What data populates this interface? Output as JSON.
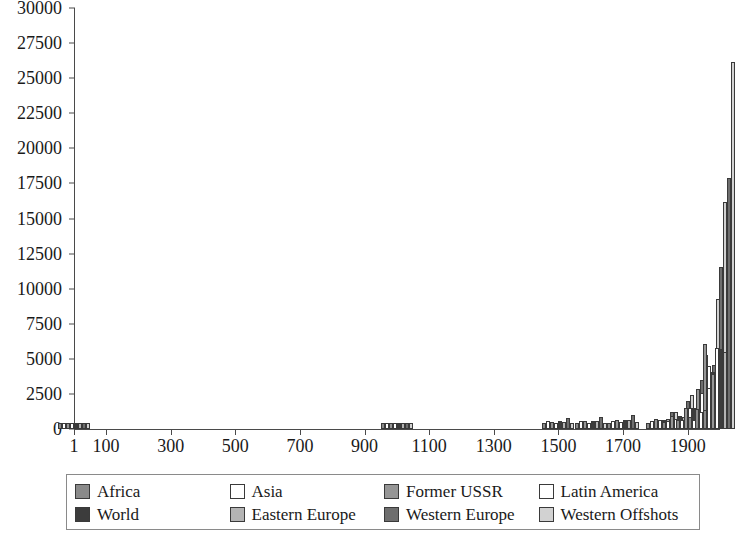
{
  "chart": {
    "type": "bar",
    "title": "",
    "background": "#ffffff"
  },
  "axes": {
    "y": {
      "label": "",
      "ticks": [
        "0",
        "2500",
        "5000",
        "7500",
        "10000",
        "12500",
        "15000",
        "17500",
        "20000",
        "22500",
        "25000",
        "27500",
        "30000"
      ],
      "min": 0,
      "max": 30000
    },
    "x": {
      "label": "",
      "ticks": [
        "1",
        "100",
        "300",
        "500",
        "700",
        "900",
        "1100",
        "1300",
        "1500",
        "1700",
        "1900"
      ],
      "min": 1,
      "max": 2000
    }
  },
  "legend": {
    "items": [
      {
        "label": "Africa",
        "color": "#8a8a8a"
      },
      {
        "label": "Asia",
        "color": "#ffffff"
      },
      {
        "label": "Former USSR",
        "color": "#969696"
      },
      {
        "label": "Latin America",
        "color": "#ffffff"
      },
      {
        "label": "World",
        "color": "#3c3c3c"
      },
      {
        "label": "Eastern Europe",
        "color": "#b4b4b4"
      },
      {
        "label": "Western Europe",
        "color": "#6e6e6e"
      },
      {
        "label": "Western Offshots",
        "color": "#d2d2d2"
      }
    ]
  },
  "chart_data": {
    "type": "bar",
    "title": "",
    "subtitle": "",
    "xlabel": "",
    "ylabel": "",
    "xlim": [
      1,
      2000
    ],
    "ylim": [
      0,
      30000
    ],
    "grid": false,
    "legend_position": "bottom",
    "categories": [
      "1",
      "1000",
      "1500",
      "1600",
      "1700",
      "1820",
      "1870",
      "1913",
      "1950",
      "1973",
      "1998"
    ],
    "series": [
      {
        "name": "Africa",
        "color": "#8a8a8a",
        "values": [
          430,
          420,
          400,
          400,
          400,
          420,
          500,
          640,
          850,
          1410,
          1370
        ]
      },
      {
        "name": "Asia",
        "color": "#ffffff",
        "values": [
          450,
          450,
          570,
          580,
          580,
          580,
          550,
          660,
          640,
          1230,
          2940
        ]
      },
      {
        "name": "Former USSR",
        "color": "#969696",
        "values": [
          400,
          400,
          500,
          550,
          610,
          690,
          940,
          1490,
          2840,
          6060,
          3890
        ]
      },
      {
        "name": "Latin America",
        "color": "#ffffff",
        "values": [
          400,
          400,
          420,
          440,
          530,
          670,
          700,
          1510,
          2550,
          4500,
          5800
        ]
      },
      {
        "name": "World",
        "color": "#3c3c3c",
        "values": [
          440,
          440,
          570,
          600,
          620,
          670,
          900,
          1510,
          2110,
          4080,
          5710
        ]
      },
      {
        "name": "Eastern Europe",
        "color": "#b4b4b4",
        "values": [
          400,
          400,
          500,
          550,
          610,
          680,
          870,
          1530,
          2110,
          4990,
          5460
        ]
      },
      {
        "name": "Western Europe",
        "color": "#6e6e6e",
        "values": [
          450,
          400,
          780,
          890,
          1020,
          1230,
          1970,
          3470,
          4590,
          11530,
          17920
        ]
      },
      {
        "name": "Western Offshots",
        "color": "#d2d2d2",
        "values": [
          400,
          400,
          400,
          400,
          480,
          1200,
          2430,
          5260,
          9290,
          16180,
          26150
        ]
      }
    ]
  }
}
